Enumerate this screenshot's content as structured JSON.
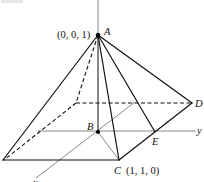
{
  "diagram": {
    "type": "pyramid-3d-coordinate-figure",
    "axes": {
      "z": {
        "label": "z"
      },
      "y": {
        "label": "y"
      },
      "x": {
        "label": "x"
      }
    },
    "points": {
      "A": {
        "label": "A",
        "coords": "(0, 0, 1)"
      },
      "B": {
        "label": "B"
      },
      "C": {
        "label": "C",
        "coords": "(1, 1, 0)"
      },
      "D": {
        "label": "D"
      },
      "E": {
        "label": "E"
      }
    },
    "colors": {
      "stroke": "#111111",
      "axis": "#555555",
      "background": "#ffffff"
    }
  }
}
